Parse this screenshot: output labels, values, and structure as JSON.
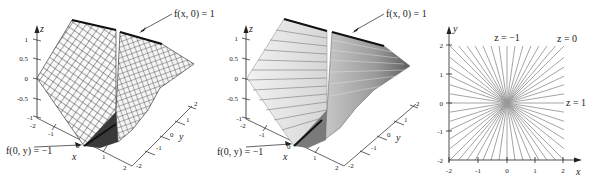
{
  "figure": {
    "panels": [
      {
        "id": "wireframe",
        "kind": "3d-surface",
        "style": "mesh",
        "axes": {
          "z_label": "z",
          "x_label": "x",
          "y_label": "y",
          "z_ticks": [
            "1",
            "0.5",
            "0",
            "-0.5",
            "-1"
          ],
          "x_ticks": [
            "-2",
            "-1",
            "0",
            "1",
            "2"
          ],
          "y_ticks": [
            "-2",
            "-1",
            "0",
            "1",
            "2"
          ]
        },
        "annotations": {
          "top": "f(x, 0) = 1",
          "bottom": "f(0, y) = −1"
        }
      },
      {
        "id": "shaded",
        "kind": "3d-surface",
        "style": "shaded-contours",
        "axes": {
          "z_label": "z",
          "x_label": "x",
          "y_label": "y",
          "z_ticks": [
            "1",
            "0.5",
            "0",
            "-0.5",
            "-1"
          ],
          "x_ticks": [
            "-2",
            "-1",
            "0",
            "1",
            "2"
          ],
          "y_ticks": [
            "-2",
            "-1",
            "0",
            "1",
            "2"
          ]
        },
        "annotations": {
          "top": "f(x, 0) = 1",
          "bottom": "f(0, y) = −1"
        }
      },
      {
        "id": "contour",
        "kind": "contour-plot",
        "axes": {
          "x_label": "x",
          "y_label": "y",
          "x_ticks": [
            "-2",
            "-1",
            "0",
            "1",
            "2"
          ],
          "y_ticks": [
            "-2",
            "-1",
            "0",
            "1",
            "2"
          ]
        },
        "annotations": {
          "vertical": "z = −1",
          "diagonal": "z = 0",
          "horizontal": "z = 1"
        }
      }
    ],
    "colors": {
      "line": "#222222",
      "contour": "#9a9a9a",
      "surface_light": "#e8e8e8",
      "surface_dark": "#6a6a6a",
      "edge_bold": "#111111"
    }
  }
}
